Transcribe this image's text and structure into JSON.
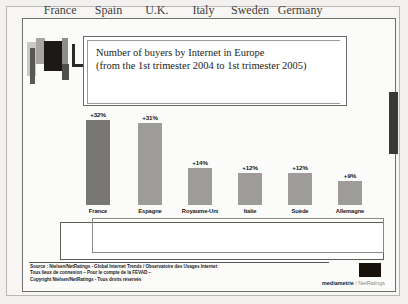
{
  "title": {
    "line1": "Number of buyers by Internet in Europe",
    "line2": "(from the 1st trimester 2004 to 1st trimester 2005)"
  },
  "english_labels": {
    "france": "France",
    "spain": "Spain",
    "uk": "U.K.",
    "italy": "Italy",
    "sweden": "Sweden",
    "germany": "Germany"
  },
  "footer": {
    "line1": "Source : Nielsen/NetRatings - Global Internet Trends / Observatoire des Usages Internet",
    "line2": "Tous lieux de connexion – Pour le compte de la FEVAD –",
    "line3": "Copyright Nielsen/NetRatings - Tous droits réservés",
    "logo_brand": "mediametrie",
    "logo_sub": "/ NetRatings"
  },
  "chart_data": {
    "type": "bar",
    "title": "Number of buyers by Internet in Europe (from the 1st trimester 2004 to 1st trimester 2005)",
    "xlabel": "",
    "ylabel": "",
    "ylim": [
      0,
      35
    ],
    "grid": false,
    "legend": "none",
    "categories": [
      "France",
      "Espagne",
      "Royaume-Uni",
      "Italie",
      "Suède",
      "Allemagne"
    ],
    "categories_en": [
      "France",
      "Spain",
      "U.K.",
      "Italy",
      "Sweden",
      "Germany"
    ],
    "values": [
      32,
      31,
      14,
      12,
      12,
      9
    ],
    "data_labels": [
      "+32%",
      "+31%",
      "+14%",
      "+12%",
      "+12%",
      "+9%"
    ],
    "bar_colors": [
      "#787775",
      "#9d9c9a",
      "#9d9c9a",
      "#9d9c9a",
      "#9d9c9a",
      "#9d9c9a"
    ]
  }
}
